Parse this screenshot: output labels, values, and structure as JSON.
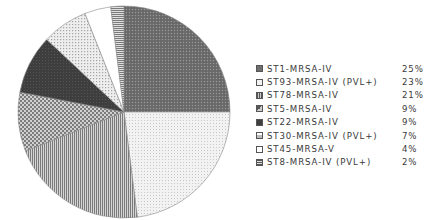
{
  "chart_data": {
    "type": "pie",
    "title": "",
    "start_angle": "12 o'clock, clockwise",
    "categories": [
      "ST1-MRSA-IV",
      "ST93-MRSA-IV (PVL+)",
      "ST78-MRSA-IV",
      "ST5-MRSA-IV",
      "ST22-MRSA-IV",
      "ST30-MRSA-IV (PVL+)",
      "ST45-MRSA-V",
      "ST8-MRSA-IV (PVL+)"
    ],
    "values": [
      25,
      23,
      21,
      9,
      9,
      7,
      4,
      2
    ],
    "value_labels": [
      "25%",
      "23%",
      "21%",
      "9%",
      "9%",
      "7%",
      "4%",
      "2%"
    ],
    "legend_position": "right",
    "patterns": [
      "dark-crosshatch",
      "light-dots",
      "vertical-stripes",
      "checker",
      "solid-dark",
      "light-dots-sparse",
      "white",
      "horizontal-stripes"
    ]
  },
  "legend": {
    "items": [
      {
        "label": "ST1-MRSA-IV",
        "value": "25%"
      },
      {
        "label": "ST93-MRSA-IV (PVL+)",
        "value": "23%"
      },
      {
        "label": "ST78-MRSA-IV",
        "value": "21%"
      },
      {
        "label": "ST5-MRSA-IV",
        "value": "9%"
      },
      {
        "label": "ST22-MRSA-IV",
        "value": "9%"
      },
      {
        "label": "ST30-MRSA-IV (PVL+)",
        "value": "7%"
      },
      {
        "label": "ST45-MRSA-V",
        "value": "4%"
      },
      {
        "label": "ST8-MRSA-IV (PVL+)",
        "value": "2%"
      }
    ]
  }
}
